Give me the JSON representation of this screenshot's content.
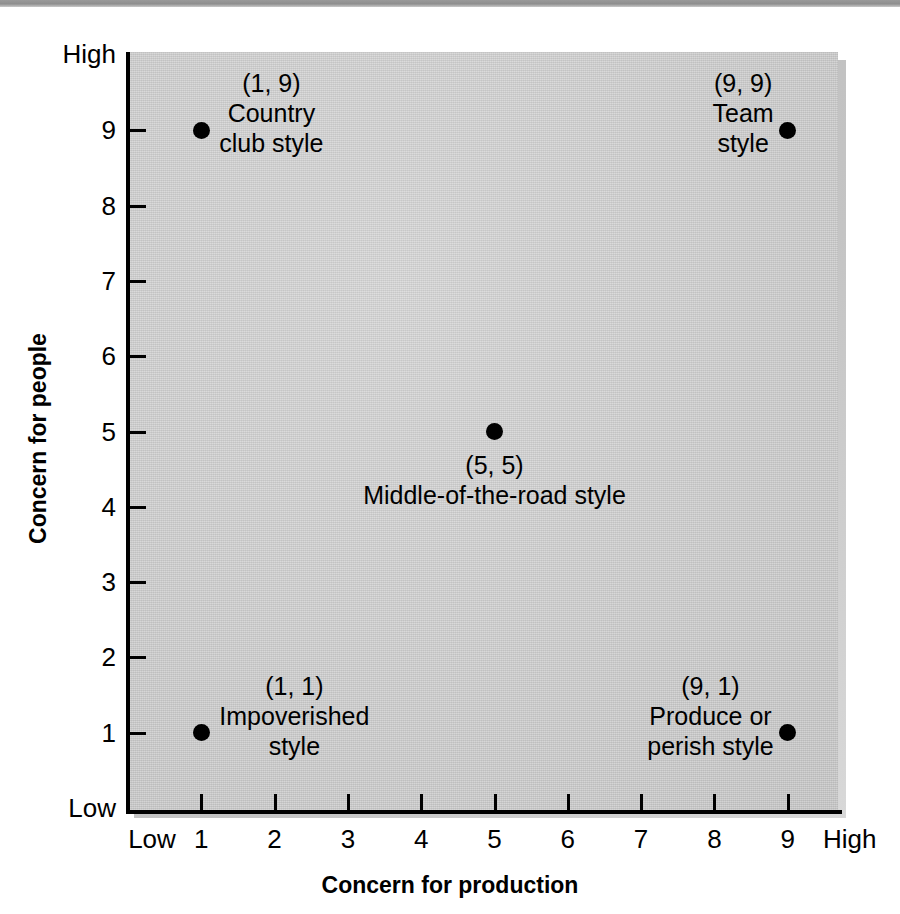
{
  "figure": {
    "title": "",
    "x_axis_title": "Concern for production",
    "y_axis_title": "Concern for people",
    "x_low_label": "Low",
    "x_high_label": "High",
    "y_low_label": "Low",
    "y_high_label": "High",
    "plot_bg_color": "#cfcfcf",
    "point_color": "#000000",
    "top_strip_color": "#8e8e8e"
  },
  "x_ticks": [
    "1",
    "2",
    "3",
    "4",
    "5",
    "6",
    "7",
    "8",
    "9"
  ],
  "y_ticks": [
    "1",
    "2",
    "3",
    "4",
    "5",
    "6",
    "7",
    "8",
    "9"
  ],
  "points": [
    {
      "coord": "(1, 9)",
      "name": "Country\nclub style",
      "x": 1,
      "y": 9
    },
    {
      "coord": "(9, 9)",
      "name": "Team\nstyle",
      "x": 9,
      "y": 9
    },
    {
      "coord": "(5, 5)",
      "name": "Middle-of-the-road style",
      "x": 5,
      "y": 5
    },
    {
      "coord": "(1, 1)",
      "name": "Impoverished\nstyle",
      "x": 1,
      "y": 1
    },
    {
      "coord": "(9, 1)",
      "name": "Produce or\nperish style",
      "x": 9,
      "y": 1
    }
  ],
  "chart_data": {
    "type": "scatter",
    "title": "",
    "xlabel": "Concern for production",
    "ylabel": "Concern for people",
    "xlim": [
      0,
      10
    ],
    "ylim": [
      0,
      10
    ],
    "grid": false,
    "legend": "none",
    "x_tick_labels": [
      "Low",
      "1",
      "2",
      "3",
      "4",
      "5",
      "6",
      "7",
      "8",
      "9",
      "High"
    ],
    "y_tick_labels": [
      "Low",
      "1",
      "2",
      "3",
      "4",
      "5",
      "6",
      "7",
      "8",
      "9",
      "High"
    ],
    "series": [
      {
        "name": "Managerial grid styles",
        "x": [
          1,
          9,
          5,
          1,
          9
        ],
        "y": [
          9,
          9,
          5,
          1,
          1
        ],
        "labels": [
          "(1, 9) Country club style",
          "(9, 9) Team style",
          "(5, 5) Middle-of-the-road style",
          "(1, 1) Impoverished style",
          "(9, 1) Produce or perish style"
        ]
      }
    ],
    "annotations": [
      {
        "text": "(1, 9)\nCountry\nclub style",
        "x": 1,
        "y": 9
      },
      {
        "text": "(9, 9)\nTeam\nstyle",
        "x": 9,
        "y": 9
      },
      {
        "text": "(5, 5)\nMiddle-of-the-road style",
        "x": 5,
        "y": 5
      },
      {
        "text": "(1, 1)\nImpoverished\nstyle",
        "x": 1,
        "y": 1
      },
      {
        "text": "(9, 1)\nProduce or\nperish style",
        "x": 9,
        "y": 1
      }
    ]
  }
}
